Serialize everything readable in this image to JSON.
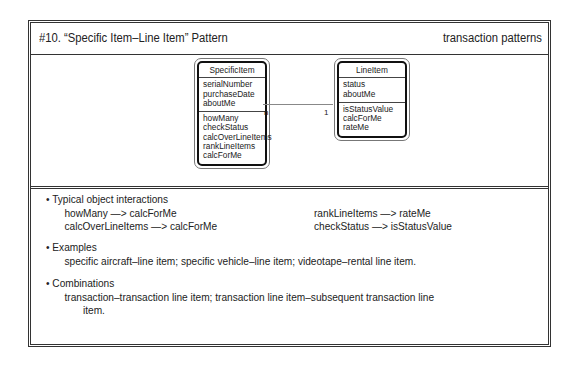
{
  "header": {
    "title": "#10. “Specific Item–Line Item” Pattern",
    "category": "transaction patterns"
  },
  "diagram": {
    "classes": [
      {
        "name": "SpecificItem",
        "attributes": [
          "serialNumber",
          "purchaseDate",
          "aboutMe"
        ],
        "services": [
          "howMany",
          "checkStatus",
          "calcOverLineItems",
          "rankLineItems",
          "calcForMe"
        ]
      },
      {
        "name": "LineItem",
        "attributes": [
          "status",
          "aboutMe"
        ],
        "services": [
          "isStatusValue",
          "calcForMe",
          "rateMe"
        ]
      }
    ],
    "association": {
      "from_multiplicity": "n",
      "to_multiplicity": "1"
    }
  },
  "notes": {
    "interactions": {
      "heading": "• Typical object interactions",
      "left": [
        "howMany —> calcForMe",
        "calcOverLineItems —> calcForMe"
      ],
      "right": [
        "rankLineItems —> rateMe",
        "checkStatus —> isStatusValue"
      ]
    },
    "examples": {
      "heading": "• Examples",
      "text": "specific aircraft–line item; specific vehicle–line item; videotape–rental line item."
    },
    "combinations": {
      "heading": "• Combinations",
      "text_line1": "transaction–transaction line item; transaction line item–subsequent transaction line",
      "text_line2": "item."
    }
  }
}
